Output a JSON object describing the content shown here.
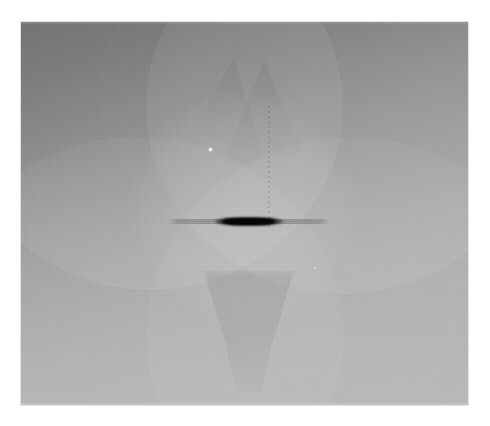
{
  "document": {
    "kind": "scientific-grayscale-image",
    "background_color": "#ffffff",
    "canvas_width": 490,
    "canvas_height": 426
  },
  "plate": {
    "name": "grayscale-interference-field",
    "left": 21,
    "top": 22,
    "width": 447,
    "height": 383,
    "border_color": "#c8c8c8",
    "base_dark_color": "#666869",
    "base_light_color": "#acaeae",
    "gradient_direction_deg": 163
  },
  "features": {
    "lobes": [
      {
        "name": "upper-left-disc",
        "brightness": "0.085",
        "position": "top-left"
      },
      {
        "name": "upper-right-disc",
        "brightness": "0.075",
        "position": "top-right"
      },
      {
        "name": "lower-left-disc",
        "brightness": "0.055",
        "position": "bottom-left"
      },
      {
        "name": "lower-right-disc",
        "brightness": "0.050",
        "position": "bottom-right"
      }
    ],
    "rings": [
      {
        "name": "left-arc"
      },
      {
        "name": "right-arc"
      },
      {
        "name": "top-arc"
      },
      {
        "name": "bottom-arc"
      },
      {
        "name": "core-arc"
      }
    ],
    "core_glow": {
      "name": "central-bright-halo",
      "color": "#ffffff",
      "opacity": 0.115
    },
    "wedges": [
      {
        "name": "upper-center-wedge-right"
      },
      {
        "name": "upper-center-wedge-left"
      }
    ],
    "funnel": {
      "name": "lower-center-funnel",
      "opacity": 0.07
    },
    "dotted_line": {
      "name": "vertical-dotted-streak",
      "x_percent": 55.2,
      "top_percent": 22,
      "height_percent": 32
    },
    "specks": [
      {
        "name": "bright-speck-primary",
        "x_percent": 42.1,
        "y_percent": 33.0,
        "color": "#f2f2f2"
      },
      {
        "name": "bright-speck-secondary",
        "x_percent": 65.5,
        "y_percent": 64.0,
        "color": "#e2e2e2"
      }
    ]
  },
  "bar": {
    "name": "central-dark-horizontal-bar",
    "left_percent": 32.9,
    "top_percent": 52.0,
    "width_percent": 36.3,
    "core_color": "#050505",
    "tail_opacity": 0.22,
    "description": "horizontal streak with opaque dark core and soft gray tails"
  },
  "chart_data": {
    "type": "heatmap",
    "title": "",
    "xlabel": "",
    "ylabel": "",
    "colormap": "grayscale",
    "value_range": [
      0.02,
      0.7
    ],
    "legend": "none",
    "grid": false,
    "profile_horizontal_midline": {
      "x": [
        0,
        10,
        20,
        30,
        33,
        38,
        45,
        50,
        55,
        62,
        69,
        75,
        85,
        100
      ],
      "values": [
        0.55,
        0.6,
        0.64,
        0.66,
        0.45,
        0.18,
        0.03,
        0.02,
        0.03,
        0.2,
        0.46,
        0.66,
        0.64,
        0.58
      ]
    },
    "profile_vertical_center": {
      "y": [
        0,
        10,
        20,
        30,
        40,
        50,
        52,
        55,
        65,
        75,
        85,
        100
      ],
      "values": [
        0.3,
        0.38,
        0.5,
        0.6,
        0.67,
        0.66,
        0.02,
        0.66,
        0.63,
        0.58,
        0.6,
        0.63
      ]
    }
  }
}
